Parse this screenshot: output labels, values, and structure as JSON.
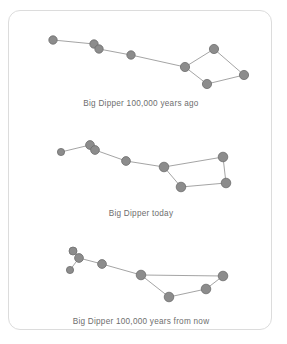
{
  "figure": {
    "name": "big-dipper-proper-motion",
    "background_color": "#ffffff",
    "card_border_color": "#dcdcdc",
    "star_fill_color": "#8c8c8c",
    "star_stroke_color": "#6d6d6d",
    "line_color": "#9a9a9a",
    "caption_color": "#6e6e6e"
  },
  "panels": [
    {
      "id": "panel-past",
      "caption": "Big Dipper 100,000 years ago",
      "caption_y": 88,
      "stars": [
        {
          "name": "handle-tip",
          "x": 44,
          "y": 29,
          "r": 4.2
        },
        {
          "name": "mizar",
          "x": 85,
          "y": 33,
          "r": 4.2
        },
        {
          "name": "alcor",
          "x": 90,
          "y": 38,
          "r": 4.2
        },
        {
          "name": "handle-mid",
          "x": 122,
          "y": 44,
          "r": 4.2
        },
        {
          "name": "bowl-junction",
          "x": 176,
          "y": 56,
          "r": 4.6
        },
        {
          "name": "bowl-top",
          "x": 205,
          "y": 38,
          "r": 4.6
        },
        {
          "name": "bowl-right",
          "x": 235,
          "y": 64,
          "r": 4.6
        },
        {
          "name": "bowl-bottom",
          "x": 198,
          "y": 73,
          "r": 4.6
        }
      ],
      "links": [
        [
          "handle-tip",
          "mizar"
        ],
        [
          "mizar",
          "alcor"
        ],
        [
          "alcor",
          "handle-mid"
        ],
        [
          "handle-mid",
          "bowl-junction"
        ],
        [
          "bowl-junction",
          "bowl-top"
        ],
        [
          "bowl-top",
          "bowl-right"
        ],
        [
          "bowl-right",
          "bowl-bottom"
        ],
        [
          "bowl-bottom",
          "bowl-junction"
        ]
      ]
    },
    {
      "id": "panel-today",
      "caption": "Big Dipper today",
      "caption_y": 198,
      "stars": [
        {
          "name": "handle-tip",
          "x": 52,
          "y": 141,
          "r": 3.6
        },
        {
          "name": "mizar",
          "x": 81,
          "y": 134,
          "r": 4.4
        },
        {
          "name": "alcor",
          "x": 86,
          "y": 139,
          "r": 4.4
        },
        {
          "name": "handle-mid",
          "x": 117,
          "y": 150,
          "r": 4.4
        },
        {
          "name": "bowl-junction",
          "x": 155,
          "y": 156,
          "r": 4.8
        },
        {
          "name": "bowl-top-right",
          "x": 214,
          "y": 146,
          "r": 4.8
        },
        {
          "name": "bowl-right",
          "x": 217,
          "y": 172,
          "r": 4.8
        },
        {
          "name": "bowl-bottom",
          "x": 172,
          "y": 176,
          "r": 4.8
        }
      ],
      "links": [
        [
          "handle-tip",
          "mizar"
        ],
        [
          "mizar",
          "alcor"
        ],
        [
          "alcor",
          "handle-mid"
        ],
        [
          "handle-mid",
          "bowl-junction"
        ],
        [
          "bowl-junction",
          "bowl-top-right"
        ],
        [
          "bowl-top-right",
          "bowl-right"
        ],
        [
          "bowl-right",
          "bowl-bottom"
        ],
        [
          "bowl-bottom",
          "bowl-junction"
        ]
      ]
    },
    {
      "id": "panel-future",
      "caption": "Big Dipper 100,000 years from now",
      "caption_y": 306,
      "stars": [
        {
          "name": "handle-tip",
          "x": 64,
          "y": 240,
          "r": 4.0
        },
        {
          "name": "mizar",
          "x": 70,
          "y": 247,
          "r": 4.4
        },
        {
          "name": "alcor",
          "x": 61,
          "y": 259,
          "r": 3.6
        },
        {
          "name": "handle-mid",
          "x": 93,
          "y": 253,
          "r": 4.4
        },
        {
          "name": "bowl-junction",
          "x": 132,
          "y": 264,
          "r": 4.8
        },
        {
          "name": "bowl-right",
          "x": 214,
          "y": 265,
          "r": 4.8
        },
        {
          "name": "bowl-mid-right",
          "x": 197,
          "y": 278,
          "r": 4.8
        },
        {
          "name": "bowl-bottom",
          "x": 160,
          "y": 286,
          "r": 4.8
        }
      ],
      "links": [
        [
          "handle-tip",
          "mizar"
        ],
        [
          "mizar",
          "alcor"
        ],
        [
          "mizar",
          "handle-mid"
        ],
        [
          "handle-mid",
          "bowl-junction"
        ],
        [
          "bowl-junction",
          "bowl-right"
        ],
        [
          "bowl-right",
          "bowl-mid-right"
        ],
        [
          "bowl-mid-right",
          "bowl-bottom"
        ],
        [
          "bowl-bottom",
          "bowl-junction"
        ]
      ]
    }
  ]
}
